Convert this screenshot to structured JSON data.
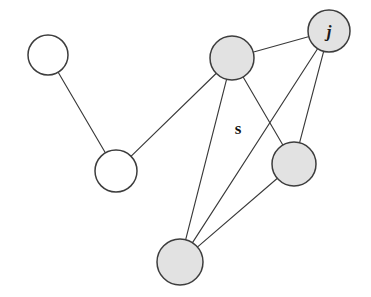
{
  "figure": {
    "name": "undirected-graph-diagram",
    "background_color": "#ffffff",
    "width": 371,
    "height": 297
  },
  "style": {
    "node_fill_shaded": "#e2e2e2",
    "node_fill_plain": "#ffffff",
    "node_stroke": "#3d3d3d",
    "edge_stroke": "#3a3a3a",
    "label_color": "#111111"
  },
  "nodes": [
    {
      "id": "n1",
      "label": "",
      "cx": 48,
      "cy": 55,
      "r": 20,
      "fill": "#ffffff",
      "shaded": false
    },
    {
      "id": "n2",
      "label": "",
      "cx": 116,
      "cy": 171,
      "r": 21,
      "fill": "#ffffff",
      "shaded": false
    },
    {
      "id": "s",
      "label": "",
      "cx": 232,
      "cy": 58,
      "r": 22,
      "fill": "#e2e2e2",
      "shaded": true
    },
    {
      "id": "j",
      "label": "j",
      "cx": 329,
      "cy": 31,
      "r": 21,
      "fill": "#e2e2e2",
      "shaded": true
    },
    {
      "id": "n5",
      "label": "",
      "cx": 294,
      "cy": 164,
      "r": 22,
      "fill": "#e2e2e2",
      "shaded": true
    },
    {
      "id": "n6",
      "label": "",
      "cx": 180,
      "cy": 262,
      "r": 23,
      "fill": "#e2e2e2",
      "shaded": true
    }
  ],
  "edges": [
    {
      "id": "e1",
      "from": "n1",
      "to": "n2"
    },
    {
      "id": "e2",
      "from": "n2",
      "to": "s"
    },
    {
      "id": "e3",
      "from": "s",
      "to": "j"
    },
    {
      "id": "e4",
      "from": "s",
      "to": "n5"
    },
    {
      "id": "e5",
      "from": "s",
      "to": "n6"
    },
    {
      "id": "e6",
      "from": "j",
      "to": "n5"
    },
    {
      "id": "e7",
      "from": "j",
      "to": "n6"
    },
    {
      "id": "e8",
      "from": "n5",
      "to": "n6"
    }
  ],
  "annotations": [
    {
      "id": "label-s",
      "text": "s",
      "x": 238,
      "y": 128
    }
  ]
}
